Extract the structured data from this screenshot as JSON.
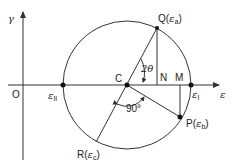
{
  "diagram": {
    "type": "Mohr's circle for strain",
    "axes": {
      "x_label": "ε",
      "y_label": "γ",
      "origin_label": "O"
    },
    "circle": {
      "center_label": "C",
      "points": [
        {
          "id": "Q",
          "label": "Q(",
          "sym": "ε",
          "sub": "a",
          "close": ")"
        },
        {
          "id": "P",
          "label": "P(",
          "sym": "ε",
          "sub": "b",
          "close": ")"
        },
        {
          "id": "R",
          "label": "R(",
          "sym": "ε",
          "sub": "c",
          "close": ")"
        }
      ],
      "principal": [
        {
          "id": "e1",
          "sym": "ε",
          "sub": "I"
        },
        {
          "id": "e2",
          "sym": "ε",
          "sub": "II"
        }
      ],
      "foot_labels": {
        "N": "N",
        "M": "M"
      },
      "angles": {
        "two_theta": "2θ",
        "right_angle": "90°"
      }
    },
    "colors": {
      "line": "#333333",
      "text": "#222222",
      "background": "#ffffff"
    }
  }
}
